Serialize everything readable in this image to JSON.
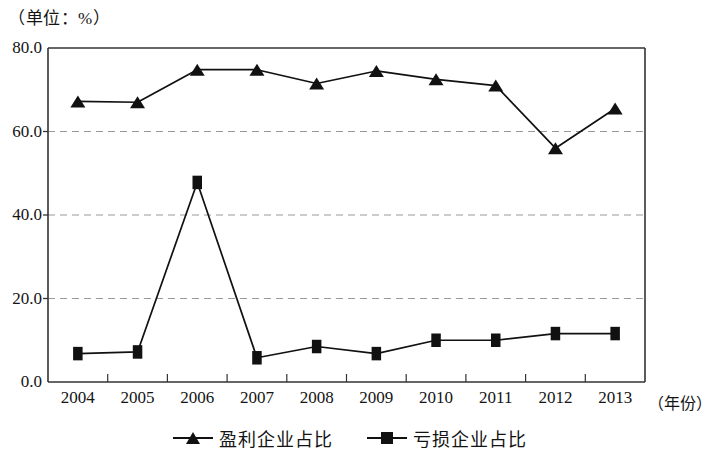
{
  "unit_label": "（单位：%）",
  "x_axis_title": "（年份）",
  "legend": {
    "items": [
      {
        "label": "盈利企业占比",
        "marker": "triangle-marker-icon"
      },
      {
        "label": "亏损企业占比",
        "marker": "square-marker-icon"
      }
    ]
  },
  "chart_data": {
    "type": "line",
    "title": "",
    "subtitle": "",
    "xlabel": "（年份）",
    "ylabel": "（单位：%）",
    "categories": [
      "2004",
      "2005",
      "2006",
      "2007",
      "2008",
      "2009",
      "2010",
      "2011",
      "2012",
      "2013"
    ],
    "x": [
      2004,
      2005,
      2006,
      2007,
      2008,
      2009,
      2010,
      2011,
      2012,
      2013
    ],
    "series": [
      {
        "name": "盈利企业占比",
        "marker": "triangle",
        "values": [
          67.2,
          67.0,
          74.8,
          74.8,
          71.5,
          74.5,
          72.5,
          71.0,
          56.0,
          65.5
        ]
      },
      {
        "name": "亏损企业占比",
        "marker": "square",
        "values": [
          6.8,
          7.2,
          47.8,
          5.8,
          8.5,
          6.8,
          10.0,
          10.0,
          11.6,
          11.6
        ]
      }
    ],
    "ylim": [
      0,
      80
    ],
    "yticks": [
      0,
      20,
      40,
      60,
      80
    ],
    "ytick_labels": [
      "0.0",
      "20.0",
      "40.0",
      "60.0",
      "80.0"
    ],
    "xlim": [
      2003.5,
      2013.5
    ],
    "grid": "horizontal-dashed",
    "legend_position": "bottom-center",
    "colors": {
      "line": "#111111",
      "marker": "#111111",
      "grid": "#9a9a9a",
      "axis": "#333333"
    }
  }
}
